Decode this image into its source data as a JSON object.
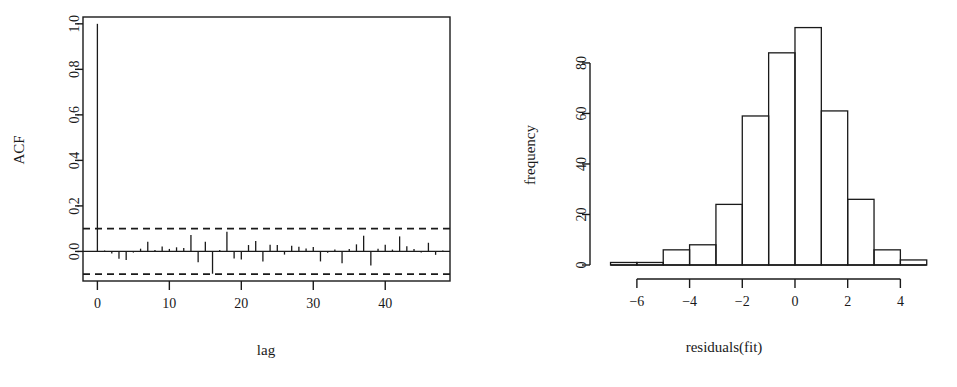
{
  "figure": {
    "background": "#ffffff",
    "ink": "#1a1a1a",
    "panel_count": 2
  },
  "chart_data": [
    {
      "type": "line",
      "plot_kind": "acf-correlogram",
      "title": "",
      "xlabel": "lag",
      "ylabel": "ACF",
      "xlim": [
        -2,
        49
      ],
      "ylim": [
        -0.13,
        1.03
      ],
      "xticks": [
        0,
        10,
        20,
        30,
        40
      ],
      "xticklabels": [
        "0",
        "10",
        "20",
        "30",
        "40"
      ],
      "yticks": [
        0.0,
        0.2,
        0.4,
        0.6,
        0.8,
        1.0
      ],
      "yticklabels": [
        "0.0",
        "0.2",
        "0.4",
        "0.6",
        "0.8",
        "1.0"
      ],
      "grid": false,
      "legend": false,
      "box": true,
      "zero_line": 0.0,
      "confidence_bounds": [
        0.1,
        -0.1
      ],
      "confidence_style": "dashed",
      "x": [
        0,
        1,
        2,
        3,
        4,
        5,
        6,
        7,
        8,
        9,
        10,
        11,
        12,
        13,
        14,
        15,
        16,
        17,
        18,
        19,
        20,
        21,
        22,
        23,
        24,
        25,
        26,
        27,
        28,
        29,
        30,
        31,
        32,
        33,
        34,
        35,
        36,
        37,
        38,
        39,
        40,
        41,
        42,
        43,
        44,
        45,
        46,
        47,
        48
      ],
      "values": [
        1.0,
        0.004,
        -0.009,
        -0.032,
        -0.038,
        -0.005,
        0.012,
        0.043,
        0.006,
        0.022,
        0.011,
        0.018,
        0.015,
        0.072,
        -0.048,
        0.042,
        -0.098,
        0.006,
        0.086,
        -0.031,
        -0.035,
        0.028,
        0.046,
        -0.044,
        0.029,
        0.028,
        -0.014,
        0.025,
        0.021,
        0.013,
        0.019,
        -0.044,
        -0.006,
        0.008,
        -0.052,
        0.011,
        0.031,
        0.069,
        -0.062,
        0.012,
        0.029,
        0.008,
        0.066,
        0.023,
        0.011,
        -0.005,
        0.038,
        -0.015,
        0.004
      ]
    },
    {
      "type": "bar",
      "plot_kind": "histogram",
      "title": "",
      "xlabel": "residuals(fit)",
      "ylabel": "frequency",
      "xlim": [
        -7.4,
        5.2
      ],
      "ylim": [
        0,
        97
      ],
      "xticks": [
        -6,
        -4,
        -2,
        0,
        2,
        4
      ],
      "xticklabels": [
        "−6",
        "−4",
        "−2",
        "0",
        "2",
        "4"
      ],
      "yticks": [
        0,
        20,
        40,
        60,
        80
      ],
      "yticklabels": [
        "0",
        "20",
        "40",
        "60",
        "80"
      ],
      "grid": false,
      "legend": false,
      "bin_width": 1,
      "bin_edges": [
        -7,
        -6,
        -5,
        -4,
        -3,
        -2,
        -1,
        0,
        1,
        2,
        3,
        4,
        5
      ],
      "categories": [
        "[-7,-6)",
        "[-6,-5)",
        "[-5,-4)",
        "[-4,-3)",
        "[-3,-2)",
        "[-2,-1)",
        "[-1,0)",
        "[0,1)",
        "[1,2)",
        "[2,3)",
        "[3,4)",
        "[4,5)"
      ],
      "values": [
        1,
        1,
        6,
        8,
        24,
        59,
        84,
        94,
        61,
        26,
        6,
        2
      ]
    }
  ]
}
